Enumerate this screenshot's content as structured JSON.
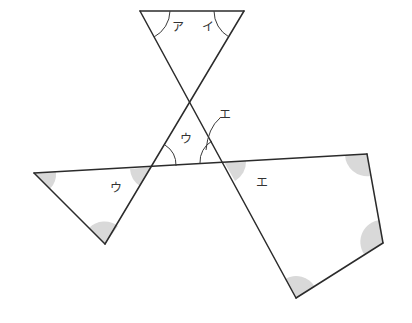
{
  "diagram": {
    "title": "",
    "labels": {
      "top_left_angle": "ア",
      "top_right_angle": "イ",
      "center_angle": "ウ",
      "center_pointer": "エ",
      "left_triangle_angle": "ウ",
      "quad_angle": "エ"
    },
    "colors": {
      "line": "#2b2b2b",
      "shade": "#d9d9d9",
      "background": "#ffffff"
    },
    "vertices": {
      "top_left": [
        140,
        11
      ],
      "top_right": [
        244,
        11
      ],
      "crossing": [
        190,
        102
      ],
      "left_intersection": [
        152,
        167
      ],
      "right_intersection": [
        224,
        162
      ],
      "left_triangle_left": [
        34,
        173
      ],
      "left_triangle_bottom": [
        105,
        244
      ],
      "quad_top_right": [
        367,
        154
      ],
      "quad_right": [
        383,
        243
      ],
      "quad_bottom": [
        296,
        298
      ]
    }
  }
}
